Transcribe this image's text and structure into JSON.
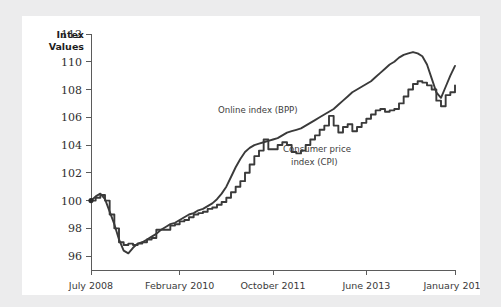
{
  "colors": {
    "page_background": "#ececed",
    "card_background": "#ffffff",
    "line_color": "#3a3a3a",
    "axis_color": "#5b5b5b",
    "label_color": "#2e2e2e"
  },
  "chart_data": {
    "type": "line",
    "title": "",
    "xlabel": "",
    "ylabel": "Intex Values",
    "ylabel_lines": [
      "Intex",
      "Values"
    ],
    "ylim": [
      95,
      112
    ],
    "ytick_values": [
      96,
      98,
      100,
      102,
      104,
      106,
      108,
      110,
      112
    ],
    "ytick_labels": [
      "96",
      "98",
      "100",
      "102",
      "104",
      "106",
      "108",
      "110",
      "112"
    ],
    "xtick_labels": [
      "July 2008",
      "February 2010",
      "October 2011",
      "June 2013",
      "January 2015"
    ],
    "xtick_positions": [
      0,
      19,
      39,
      59,
      78
    ],
    "x_range": [
      0,
      78
    ],
    "x_unit": "months since July 2008",
    "grid": false,
    "legend": "inline-annotations",
    "annotations": [
      {
        "text": "Online index (BPP)",
        "series": "Online index (BPP)",
        "x_px": 218,
        "y_px": 113
      },
      {
        "text": "Consumer price",
        "series": "Consumer price index (CPI)",
        "x_px": 283,
        "y_px": 152
      },
      {
        "text": "index (CPI)",
        "series": "Consumer price index (CPI)",
        "x_px": 291,
        "y_px": 165
      }
    ],
    "series": [
      {
        "name": "Online index (BPP)",
        "style": "smooth",
        "values": [
          100.0,
          100.3,
          100.5,
          100.1,
          99.2,
          98.3,
          97.2,
          96.4,
          96.2,
          96.6,
          96.9,
          97.0,
          97.2,
          97.4,
          97.6,
          97.9,
          98.1,
          98.3,
          98.4,
          98.6,
          98.8,
          99.0,
          99.1,
          99.3,
          99.4,
          99.6,
          99.8,
          100.1,
          100.5,
          101.0,
          101.7,
          102.4,
          103.0,
          103.5,
          103.8,
          104.0,
          104.1,
          104.2,
          104.3,
          104.4,
          104.5,
          104.7,
          104.9,
          105.0,
          105.1,
          105.2,
          105.4,
          105.6,
          105.8,
          106.0,
          106.2,
          106.4,
          106.6,
          106.9,
          107.2,
          107.5,
          107.8,
          108.0,
          108.2,
          108.4,
          108.6,
          108.9,
          109.2,
          109.5,
          109.8,
          110.0,
          110.3,
          110.5,
          110.6,
          110.7,
          110.6,
          110.4,
          109.8,
          108.8,
          107.8,
          107.4,
          108.2,
          109.0,
          109.7
        ]
      },
      {
        "name": "Consumer price index (CPI)",
        "style": "stepped",
        "values": [
          100.0,
          100.2,
          100.4,
          100.0,
          99.0,
          98.0,
          97.0,
          96.8,
          96.9,
          96.8,
          96.9,
          97.0,
          97.2,
          97.3,
          97.9,
          97.9,
          97.9,
          98.2,
          98.3,
          98.5,
          98.6,
          98.8,
          99.0,
          99.1,
          99.2,
          99.4,
          99.5,
          99.7,
          99.9,
          100.2,
          100.6,
          101.0,
          101.4,
          102.0,
          102.6,
          103.2,
          103.6,
          104.4,
          103.7,
          103.7,
          104.0,
          104.2,
          104.0,
          103.5,
          103.4,
          103.6,
          104.0,
          104.4,
          104.7,
          105.1,
          105.4,
          106.1,
          105.4,
          104.9,
          105.3,
          105.5,
          105.0,
          105.3,
          105.6,
          105.9,
          106.2,
          106.5,
          106.6,
          106.4,
          106.5,
          106.6,
          107.0,
          107.5,
          108.0,
          108.4,
          108.6,
          108.5,
          108.3,
          108.0,
          107.2,
          106.8,
          107.6,
          107.8,
          108.3
        ]
      }
    ]
  }
}
